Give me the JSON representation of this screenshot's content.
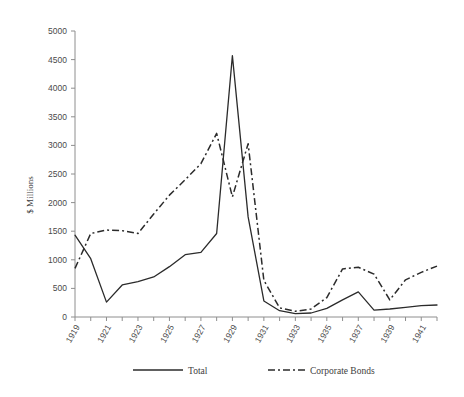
{
  "chart_data": {
    "type": "line",
    "title": "",
    "xlabel": "",
    "ylabel": "$ Millions",
    "ylim": [
      0,
      5000
    ],
    "ytick_step": 500,
    "grid": false,
    "legend_position": "bottom",
    "x": [
      1919,
      1920,
      1921,
      1922,
      1923,
      1924,
      1925,
      1926,
      1927,
      1928,
      1929,
      1930,
      1931,
      1932,
      1933,
      1934,
      1935,
      1936,
      1937,
      1938,
      1939,
      1940,
      1941,
      1942
    ],
    "xtick_labels": [
      "1919",
      "",
      "1921",
      "",
      "1923",
      "",
      "1925",
      "",
      "1927",
      "",
      "1929",
      "",
      "1931",
      "",
      "1933",
      "",
      "1935",
      "",
      "1937",
      "",
      "1939",
      "",
      "1941",
      ""
    ],
    "ytick_labels": [
      "0",
      "500",
      "1000",
      "1500",
      "2000",
      "2500",
      "3000",
      "3500",
      "4000",
      "4500",
      "5000"
    ],
    "series": [
      {
        "name": "Total",
        "style": "solid",
        "values": [
          1430,
          1020,
          260,
          560,
          620,
          700,
          880,
          1090,
          1130,
          1460,
          4570,
          1750,
          280,
          110,
          60,
          70,
          150,
          300,
          440,
          120,
          140,
          170,
          200,
          210
        ]
      },
      {
        "name": "Corporate Bonds",
        "style": "dash-dot",
        "values": [
          850,
          1460,
          1520,
          1510,
          1460,
          1800,
          2130,
          2400,
          2680,
          3210,
          2100,
          3030,
          640,
          160,
          100,
          140,
          340,
          840,
          870,
          750,
          300,
          650,
          780,
          890
        ]
      }
    ]
  },
  "legend": {
    "items": [
      {
        "label": "Total",
        "marker": "solid-line"
      },
      {
        "label": "Corporate Bonds",
        "marker": "dash-dot-line"
      }
    ]
  }
}
